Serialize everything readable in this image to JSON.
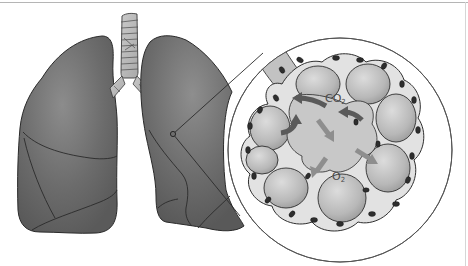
{
  "figure": {
    "labels": {
      "co2": "CO",
      "co2_sub": "2",
      "o2": "O",
      "o2_sub": "2"
    },
    "parts": [
      "left-lung",
      "right-lung",
      "trachea",
      "bronchi",
      "magnifier-circle",
      "alveoli-cluster",
      "capillary-cells",
      "gas-flow-arrows"
    ],
    "colors": {
      "lung_fill": "#6e6e6e",
      "lung_highlight": "#8a8a8a",
      "outline": "#2a2a2a",
      "alveoli_fill": "#bdbdbd",
      "alveoli_highlight": "#d4d4d4",
      "capillary_fill": "#e3e3e3",
      "cell_nucleus": "#2e2e2e",
      "arrow_dark": "#5a5a5a",
      "arrow_light": "#8e8e8e",
      "magnifier_stroke": "#555555",
      "background": "#ffffff"
    }
  }
}
